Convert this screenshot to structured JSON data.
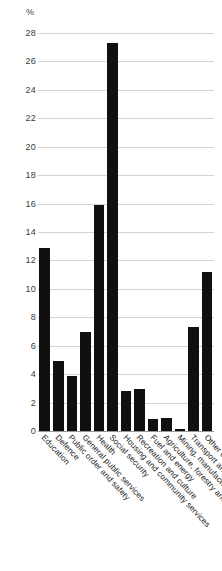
{
  "chart_data": {
    "type": "bar",
    "title": "",
    "subtitle": "",
    "xlabel": "",
    "ylabel": "%",
    "unit_label": "%",
    "ylim": [
      0,
      28
    ],
    "ytick_step": 2,
    "yticks": [
      0,
      2,
      4,
      6,
      8,
      10,
      12,
      14,
      16,
      18,
      20,
      22,
      24,
      26,
      28
    ],
    "ytick_labels": [
      "0",
      "2",
      "4",
      "6",
      "8",
      "10",
      "12",
      "14",
      "16",
      "18",
      "20",
      "22",
      "24",
      "26",
      "28"
    ],
    "grid": true,
    "grid_axis": "y",
    "legend": false,
    "legend_position": "none",
    "bar_color": "#101010",
    "grid_color": "#d4d4d4",
    "axis_color": "#9a9a9a",
    "text_color": "#3a3a3a",
    "categories": [
      "Education",
      "Defence",
      "Public order and safety",
      "General public services",
      "Health",
      "Social security",
      "Housing and community services",
      "Recreation and culture",
      "Fuel and energy",
      "Agriculture, forestry and fishing",
      "Mining, manufacturing and construction",
      "Transport and communications",
      "Other economic affairs"
    ],
    "values": [
      12.9,
      4.9,
      3.9,
      7.0,
      15.9,
      27.3,
      2.85,
      2.95,
      0.85,
      0.95,
      0.15,
      7.3,
      11.2
    ]
  }
}
